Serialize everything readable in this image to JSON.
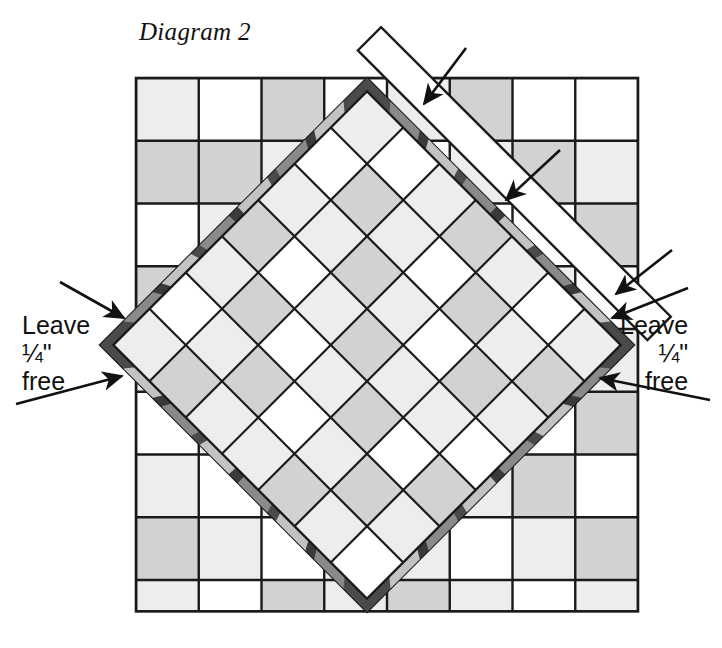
{
  "figure": {
    "title": "Diagram 2",
    "kind": "quilt-block-assembly-diagram"
  },
  "callouts": {
    "left": {
      "line1": "Leave",
      "line2": "¼\"",
      "line3": "free"
    },
    "right": {
      "line1": "Leave",
      "line2": "¼\"",
      "line3": "free"
    }
  },
  "colors": {
    "ink": "#111111",
    "outline": "#1a1a1a",
    "paper": "#ffffff",
    "light_gray": "#ededed",
    "mid_gray": "#d2d2d2",
    "dark_gray": "#9a9a9a",
    "border_dark": "#4a4a4a",
    "border_darker": "#3a3a3a",
    "border_light": "#c9c9c9",
    "border_mid": "#8d8d8d"
  },
  "background_grid": {
    "label": "background-patchwork-grid",
    "origin_x": 136,
    "origin_y": 78,
    "cell": 62.75,
    "cols": 8,
    "rows": 8.5,
    "shades": [
      [
        "light",
        "white",
        "mid",
        "white",
        "light",
        "mid",
        "white",
        "white"
      ],
      [
        "mid",
        "mid",
        "light",
        "light",
        "white",
        "light",
        "mid",
        "light"
      ],
      [
        "white",
        "light",
        "light",
        "mid",
        "mid",
        "white",
        "white",
        "mid"
      ],
      [
        "mid",
        "white",
        "mid",
        "light",
        "light",
        "mid",
        "light",
        "white"
      ],
      [
        "light",
        "mid",
        "white",
        "white",
        "mid",
        "light",
        "mid",
        "light"
      ],
      [
        "white",
        "light",
        "mid",
        "light",
        "white",
        "mid",
        "white",
        "mid"
      ],
      [
        "light",
        "white",
        "light",
        "mid",
        "mid",
        "light",
        "mid",
        "white"
      ],
      [
        "mid",
        "light",
        "white",
        "light",
        "light",
        "white",
        "light",
        "mid"
      ],
      [
        "light",
        "white",
        "mid",
        "light",
        "mid",
        "light",
        "white",
        "light"
      ]
    ]
  },
  "diamond_block": {
    "label": "rotated-quilt-block",
    "center_x": 367,
    "center_y": 345,
    "half_diagonal": 267,
    "rotation_deg": 45,
    "inner_cols": 7,
    "inner_rows": 7,
    "border_width_px": 13,
    "inner_shades": [
      [
        "light",
        "white",
        "light",
        "mid",
        "light",
        "white",
        "light"
      ],
      [
        "white",
        "mid",
        "light",
        "white",
        "mid",
        "light",
        "mid"
      ],
      [
        "light",
        "light",
        "mid",
        "light",
        "white",
        "mid",
        "light"
      ],
      [
        "mid",
        "white",
        "light",
        "mid",
        "light",
        "light",
        "white"
      ],
      [
        "light",
        "mid",
        "white",
        "light",
        "mid",
        "white",
        "mid"
      ],
      [
        "white",
        "light",
        "mid",
        "white",
        "light",
        "mid",
        "light"
      ],
      [
        "light",
        "mid",
        "light",
        "light",
        "mid",
        "light",
        "white"
      ]
    ]
  },
  "flap": {
    "label": "unsewn-white-flap-strip",
    "description": "white unstitched border strip folded open at upper right"
  },
  "arrows": {
    "count": 6,
    "left": [
      {
        "name": "arrow-left-upper"
      },
      {
        "name": "arrow-left-lower"
      }
    ],
    "right": [
      {
        "name": "arrow-right-upper"
      },
      {
        "name": "arrow-right-lower"
      }
    ],
    "flap": [
      {
        "name": "arrow-flap-top"
      },
      {
        "name": "arrow-flap-middle"
      },
      {
        "name": "arrow-flap-bottom"
      }
    ]
  }
}
